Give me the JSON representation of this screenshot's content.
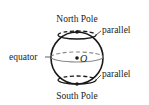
{
  "diagram": {
    "type": "sphere-latitude-diagram",
    "labels": {
      "north_pole": "North Pole",
      "south_pole": "South Pole",
      "equator": "equator",
      "parallel_upper": "parallel",
      "parallel_lower": "parallel",
      "center": "O"
    },
    "colors": {
      "stroke": "#1a1a1a",
      "equator": "#8a8a8a",
      "text": "#222222",
      "background": "#ffffff"
    }
  }
}
